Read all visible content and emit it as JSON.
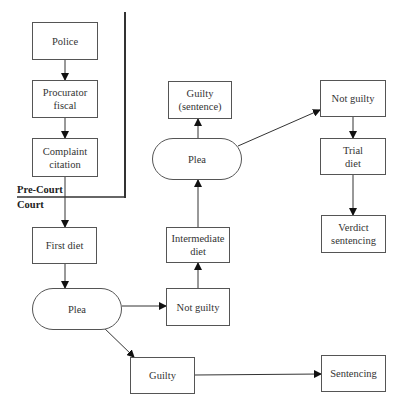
{
  "regions": {
    "pre_court": "Pre-Court",
    "court": "Court"
  },
  "nodes": {
    "police": "Police",
    "procurator_fiscal": "Procurator\nfiscal",
    "complaint_citation": "Complaint\ncitation",
    "first_diet": "First diet",
    "plea_first": "Plea",
    "not_guilty_first": "Not guilty",
    "intermediate_diet": "Intermediate\ndiet",
    "plea_second": "Plea",
    "guilty_sentence": "Guilty\n(sentence)",
    "not_guilty_second": "Not guilty",
    "trial_diet": "Trial\ndiet",
    "verdict_sentencing": "Verdict\nsentencing",
    "guilty_first": "Guilty",
    "sentencing": "Sentencing"
  },
  "edges": [
    {
      "from": "police",
      "to": "procurator_fiscal"
    },
    {
      "from": "procurator_fiscal",
      "to": "complaint_citation"
    },
    {
      "from": "complaint_citation",
      "to": "first_diet"
    },
    {
      "from": "first_diet",
      "to": "plea_first"
    },
    {
      "from": "plea_first",
      "to": "not_guilty_first"
    },
    {
      "from": "plea_first",
      "to": "guilty_first"
    },
    {
      "from": "guilty_first",
      "to": "sentencing"
    },
    {
      "from": "not_guilty_first",
      "to": "intermediate_diet"
    },
    {
      "from": "intermediate_diet",
      "to": "plea_second"
    },
    {
      "from": "plea_second",
      "to": "guilty_sentence"
    },
    {
      "from": "plea_second",
      "to": "not_guilty_second"
    },
    {
      "from": "not_guilty_second",
      "to": "trial_diet"
    },
    {
      "from": "trial_diet",
      "to": "verdict_sentencing"
    }
  ],
  "colors": {
    "line": "#333333",
    "border": "#555555",
    "background": "#ffffff"
  }
}
